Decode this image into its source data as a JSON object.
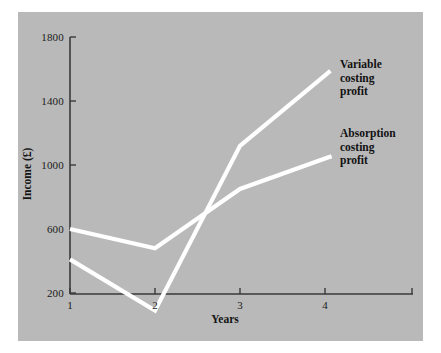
{
  "figure": {
    "page_background": "#ffffff",
    "panel_background": "#b9b9b9",
    "axis_color": "#3a3a3a",
    "line_color": "#ffffff"
  },
  "chart_data": {
    "type": "line",
    "title": "",
    "subtitle": "",
    "xlabel": "Years",
    "ylabel": "Income (£)",
    "x": [
      1,
      2,
      3,
      4
    ],
    "categories": [
      "1",
      "2",
      "3",
      "4"
    ],
    "xtick_labels": [
      "1",
      "2",
      "3",
      "4"
    ],
    "ytick_labels": [
      "200",
      "600",
      "1000",
      "1400",
      "1800"
    ],
    "yticks": [
      200,
      600,
      1000,
      1400,
      1800
    ],
    "xlim": [
      1,
      5
    ],
    "ylim": [
      0,
      1900
    ],
    "grid": false,
    "legend": "inline-annotations",
    "legend_position": "right",
    "series": [
      {
        "name": "Variable costing profit",
        "color": "#ffffff",
        "values": [
          410,
          90,
          1120,
          1560
        ],
        "annotation": [
          "Variable",
          "costing",
          "profit"
        ]
      },
      {
        "name": "Absorption costing profit",
        "color": "#ffffff",
        "values": [
          600,
          480,
          850,
          1040
        ],
        "annotation": [
          "Absorption",
          "costing",
          "profit"
        ]
      }
    ],
    "annotations": [
      {
        "text": "Variable costing profit",
        "lines": [
          "Variable",
          "costing",
          "profit"
        ]
      },
      {
        "text": "Absorption costing profit",
        "lines": [
          "Absorption",
          "costing",
          "profit"
        ]
      }
    ]
  },
  "axes": {
    "y_ticks": [
      {
        "label": "1800",
        "value": 1800
      },
      {
        "label": "1400",
        "value": 1400
      },
      {
        "label": "1000",
        "value": 1000
      },
      {
        "label": "600",
        "value": 600
      },
      {
        "label": "200",
        "value": 200
      }
    ],
    "x_ticks": [
      {
        "label": "1",
        "value": 1
      },
      {
        "label": "2",
        "value": 2
      },
      {
        "label": "3",
        "value": 3
      },
      {
        "label": "4",
        "value": 4
      }
    ],
    "y_title": "Income (£)",
    "x_title": "Years"
  }
}
